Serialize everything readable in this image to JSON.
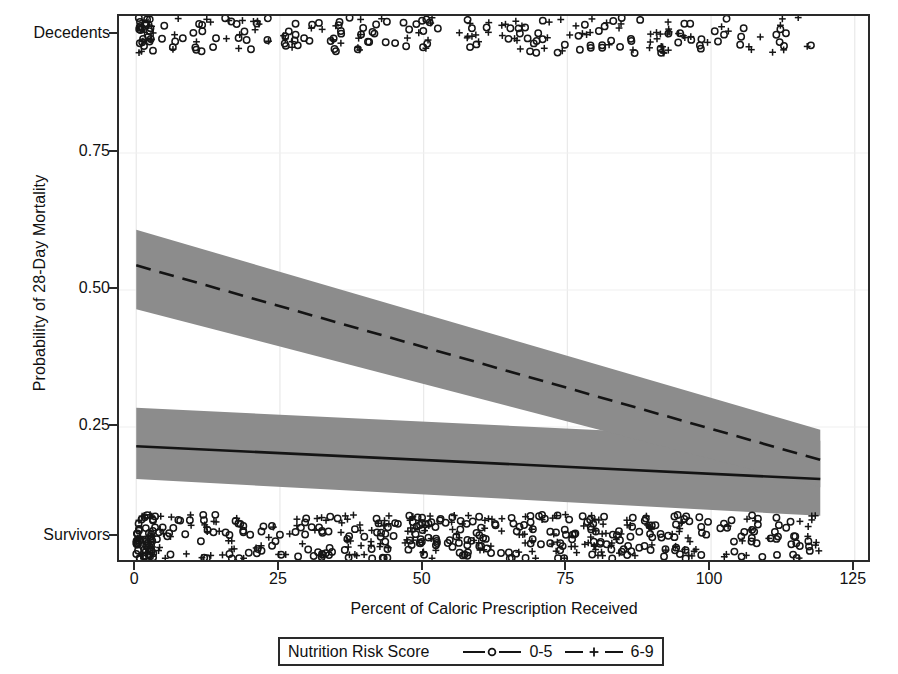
{
  "chart_data": {
    "type": "line",
    "title": "",
    "subtitle": "",
    "xlabel": "Percent of Caloric Prescription Received",
    "ylabel": "Probability of 28-Day Mortality",
    "xlim": [
      -3,
      128
    ],
    "ylim": [
      0,
      1
    ],
    "grid": true,
    "x_ticks": [
      {
        "value": 0,
        "label": "0"
      },
      {
        "value": 25,
        "label": "25"
      },
      {
        "value": 50,
        "label": "50"
      },
      {
        "value": 75,
        "label": "75"
      },
      {
        "value": 100,
        "label": "100"
      },
      {
        "value": 125,
        "label": "125"
      }
    ],
    "y_ticks": [
      {
        "value": 0.965,
        "label": "Decedents"
      },
      {
        "value": 0.75,
        "label": "0.75"
      },
      {
        "value": 0.5,
        "label": "0.50"
      },
      {
        "value": 0.25,
        "label": "0.25"
      },
      {
        "value": 0.05,
        "label": "Survivors"
      }
    ],
    "legend": {
      "title": "Nutrition Risk Score",
      "position": "below-axis",
      "entries": [
        {
          "label": "0-5",
          "line_style": "solid",
          "marker": "circle"
        },
        {
          "label": "6-9",
          "line_style": "dashed",
          "marker": "plus"
        }
      ]
    },
    "series": [
      {
        "name": "0-5",
        "line_style": "solid",
        "marker": "circle",
        "x": [
          0,
          119
        ],
        "y": [
          0.215,
          0.155
        ],
        "ci_upper": [
          0.285,
          0.225
        ],
        "ci_lower": [
          0.155,
          0.088
        ],
        "band_color": "#8c8c8c",
        "line_color": "#141414"
      },
      {
        "name": "6-9",
        "line_style": "dashed",
        "marker": "plus",
        "x": [
          0,
          119
        ],
        "y": [
          0.545,
          0.19
        ],
        "ci_upper": [
          0.61,
          0.245
        ],
        "ci_lower": [
          0.465,
          0.14
        ],
        "band_color": "#8c8c8c",
        "line_color": "#141414"
      }
    ],
    "rug_rows": [
      {
        "name": "Decedents",
        "y_label": "Decedents",
        "y": 0.965,
        "n_circles": 150,
        "n_plus": 110
      },
      {
        "name": "Survivors",
        "y_label": "Survivors",
        "y": 0.05,
        "n_circles": 330,
        "n_plus": 210
      }
    ],
    "annotations": [],
    "colors": {
      "band": "#8c8c8c",
      "line": "#141414",
      "axis": "#2a2a2a",
      "grid": "#e9e9e9",
      "text": "#111111",
      "background": "#ffffff"
    }
  }
}
